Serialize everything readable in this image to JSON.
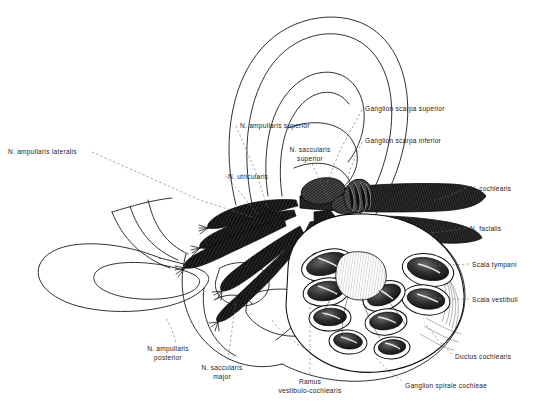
{
  "figure": {
    "domain": "anatomical-line-illustration",
    "background_color": "#ffffff",
    "ink_color": "#111111",
    "leader_line_style": "dashed",
    "width": 535,
    "height": 404
  },
  "labels": [
    {
      "id": "n-ampullaris-lateralis",
      "text": "N. ampullaris lateralis",
      "x": 8,
      "y": 148,
      "align": "left",
      "leader": [
        [
          92,
          152
        ],
        [
          200,
          200
        ],
        [
          255,
          218
        ]
      ]
    },
    {
      "id": "n-ampullaris-superior",
      "text": "N. ampullaris superior",
      "x": 240,
      "y": 122,
      "align": "left",
      "leader": [
        [
          236,
          126
        ],
        [
          255,
          170
        ],
        [
          268,
          208
        ]
      ]
    },
    {
      "id": "n-utricularis",
      "text": "N. utricularis",
      "x": 228,
      "y": 173,
      "align": "left",
      "leader": [
        [
          226,
          176
        ],
        [
          243,
          196
        ],
        [
          258,
          215
        ]
      ]
    },
    {
      "id": "n-saccularis-superior",
      "text": "N. saccularis superior",
      "x": 273,
      "y": 146,
      "align": "center",
      "two_line": true,
      "line1": "N. saccularis",
      "line2": "superior",
      "leader": [
        [
          312,
          164
        ],
        [
          322,
          184
        ],
        [
          330,
          200
        ]
      ]
    },
    {
      "id": "ganglion-scarpa-superior",
      "text": "Ganglion scarpa superior",
      "x": 365,
      "y": 105,
      "align": "left",
      "leader": [
        [
          362,
          110
        ],
        [
          340,
          150
        ],
        [
          326,
          186
        ]
      ]
    },
    {
      "id": "ganglion-scarpa-inferior",
      "text": "Ganglion scarpa inferior",
      "x": 365,
      "y": 137,
      "align": "left",
      "leader": [
        [
          362,
          142
        ],
        [
          350,
          170
        ],
        [
          344,
          197
        ]
      ]
    },
    {
      "id": "n-cochlearis",
      "text": "N. cochlearis",
      "x": 470,
      "y": 185,
      "align": "left",
      "leader": [
        [
          466,
          188
        ],
        [
          448,
          196
        ],
        [
          432,
          201
        ]
      ]
    },
    {
      "id": "n-facialis",
      "text": "N. facialis",
      "x": 470,
      "y": 225,
      "align": "left",
      "leader": [
        [
          466,
          228
        ],
        [
          448,
          231
        ],
        [
          430,
          233
        ]
      ]
    },
    {
      "id": "scala-tympani",
      "text": "Scala tympani",
      "x": 472,
      "y": 261,
      "align": "left",
      "leader": [
        [
          469,
          264
        ],
        [
          450,
          265
        ],
        [
          432,
          266
        ]
      ]
    },
    {
      "id": "scala-vestibuli",
      "text": "Scala vestibuli",
      "x": 472,
      "y": 296,
      "align": "left",
      "leader": [
        [
          469,
          299
        ],
        [
          450,
          299
        ],
        [
          433,
          298
        ]
      ]
    },
    {
      "id": "ductus-cochlearis",
      "text": "Ductus cochlearis",
      "x": 455,
      "y": 353,
      "align": "left",
      "leader": [
        [
          452,
          354
        ],
        [
          438,
          340
        ],
        [
          424,
          322
        ]
      ]
    },
    {
      "id": "ganglion-spirale-cochleae",
      "text": "Ganglion spirale cochleae",
      "x": 405,
      "y": 382,
      "align": "left",
      "leader": [
        [
          402,
          381
        ],
        [
          390,
          372
        ],
        [
          376,
          358
        ]
      ]
    },
    {
      "id": "ramus-vestibulo-cochlearis",
      "text": "Ramus vestibulo-cochlearis",
      "x": 310,
      "y": 378,
      "align": "center",
      "two_line": true,
      "line1": "Ramus",
      "line2": "vestibulo-cochlearis",
      "leader": [
        [
          310,
          374
        ],
        [
          310,
          340
        ],
        [
          310,
          300
        ]
      ]
    },
    {
      "id": "n-saccularis-major",
      "text": "N. saccularis major",
      "x": 222,
      "y": 364,
      "align": "center",
      "two_line": true,
      "line1": "N. saccularis",
      "line2": "major",
      "leader": [
        [
          228,
          360
        ],
        [
          232,
          330
        ],
        [
          236,
          300
        ]
      ]
    },
    {
      "id": "n-ampullaris-posterior",
      "text": "N. ampullaris posterior",
      "x": 168,
      "y": 345,
      "align": "center",
      "two_line": true,
      "line1": "N. ampullaris",
      "line2": "posterior",
      "leader": [
        [
          176,
          342
        ],
        [
          172,
          330
        ],
        [
          166,
          318
        ]
      ]
    }
  ]
}
